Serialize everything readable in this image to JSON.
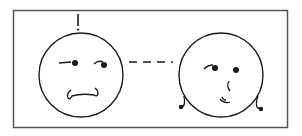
{
  "diagram": {
    "colors": {
      "stroke": "#1a1a1a",
      "frame": "#555555",
      "background": "#ffffff"
    },
    "frame": {
      "x": 13,
      "y": 10,
      "width": 274,
      "height": 117
    },
    "left_face": {
      "label": "worried-face",
      "expression": "frowning",
      "center": [
        84,
        76
      ],
      "radius": 42,
      "exclamation_mark": true
    },
    "right_face": {
      "label": "smiling-face",
      "expression": "smiling",
      "center": [
        221,
        76
      ],
      "radius": 42,
      "curls": true
    },
    "connector": {
      "style": "dashed",
      "from": [
        128,
        62
      ],
      "to": [
        175,
        62
      ]
    }
  }
}
